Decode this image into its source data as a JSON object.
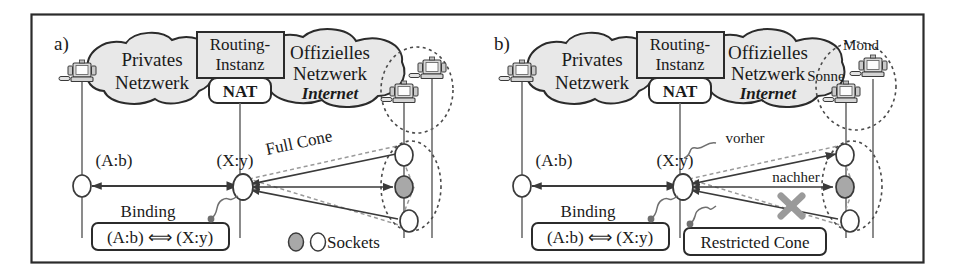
{
  "figure": {
    "frame_color": "#2b2b2b",
    "background": "#ffffff",
    "cloud_fill": "#e8e8e8",
    "box_fill": "#e8e8e8",
    "socket_open_fill": "#ffffff",
    "socket_filled_fill": "#a8a8a8",
    "block_marker_color": "#9a9a9a",
    "line_color": "#3a3a3a"
  },
  "panels": [
    {
      "tag": "a)",
      "private_cloud": "Privates\nNetzwerk",
      "routing_box": "Routing-\nInstanz",
      "nat_box": "NAT",
      "official_cloud": "Offizielles\nNetzwerk",
      "internet": "Internet",
      "internal_port": "(A:b)",
      "external_port": "(X:y)",
      "binding_caption": "Binding",
      "binding_value": "(A:b) ⟺ (X:y)",
      "cone_label": "Full Cone",
      "legend": "Sockets",
      "hosts": [],
      "sockets": [
        "open",
        "filled",
        "open"
      ]
    },
    {
      "tag": "b)",
      "private_cloud": "Privates\nNetzwerk",
      "routing_box": "Routing-\nInstanz",
      "nat_box": "NAT",
      "official_cloud": "Offizielles\nNetzwerk",
      "internet": "Internet",
      "internal_port": "(A:b)",
      "external_port": "(X:y)",
      "binding_caption": "Binding",
      "binding_value": "(A:b) ⟺ (X:y)",
      "cone_label": "Restricted Cone",
      "timing_before": "vorher",
      "timing_after": "nachher",
      "hosts": [
        "Mond",
        "Sonne"
      ],
      "sockets": [
        "open",
        "filled",
        "open"
      ]
    }
  ]
}
